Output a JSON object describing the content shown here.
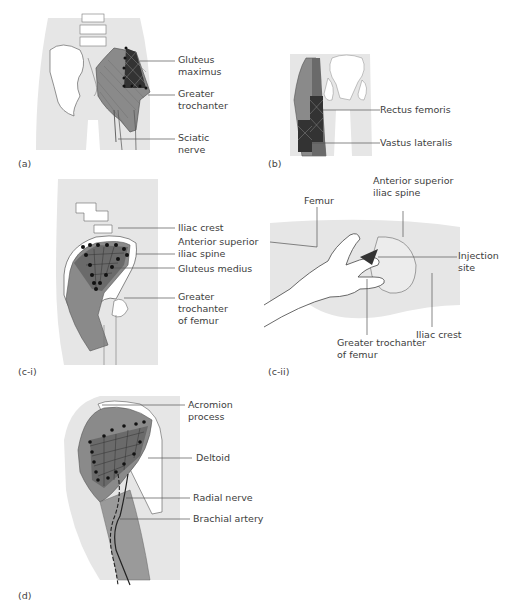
{
  "figure": {
    "panels": [
      {
        "id": "a",
        "caption": "(a)",
        "labels": [
          "Gluteus\nmaximus",
          "Greater\ntrochanter",
          "Sciatic\nnerve"
        ]
      },
      {
        "id": "b",
        "caption": "(b)",
        "labels": [
          "Rectus femoris",
          "Vastus lateralis"
        ]
      },
      {
        "id": "c-i",
        "caption": "(c-i)",
        "labels": [
          "Iliac crest",
          "Anterior superior\niliac spine",
          "Gluteus medius",
          "Greater\ntrochanter\nof femur"
        ]
      },
      {
        "id": "c-ii",
        "caption": "(c-ii)",
        "labels": [
          "Femur",
          "Anterior superior\niliac spine",
          "Injection\nsite",
          "Greater trochanter\nof femur",
          "Iliac crest"
        ]
      },
      {
        "id": "d",
        "caption": "(d)",
        "labels": [
          "Acromion\nprocess",
          "Deltoid",
          "Radial nerve",
          "Brachial artery"
        ]
      }
    ]
  },
  "colors": {
    "body_fill": "#e6e6e6",
    "bone_fill": "#ffffff",
    "muscle_fill": "#8a8a8a",
    "muscle_dark": "#555555",
    "grid_dark": "#2a2a2a",
    "leader_line": "#555555"
  }
}
